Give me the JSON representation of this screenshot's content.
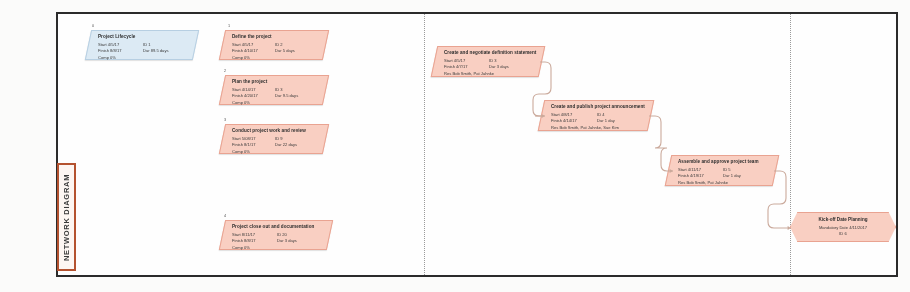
{
  "page": {
    "vertical_label": "NETWORK DIAGRAM",
    "accent_color": "#b4522f",
    "node_fill": "#f9cfc2",
    "node_stroke": "#e9a391",
    "lifecycle_fill": "#dceaf4",
    "lifecycle_stroke": "#b7cfe2",
    "frame_color": "#2b2b2b"
  },
  "nodes": [
    {
      "id_tag": "0",
      "title": "Project Lifecycle",
      "rows": [
        [
          "Start  4/5/17",
          "ID  1"
        ],
        [
          "Finish  8/8/17",
          "Dur  89.5 days"
        ],
        [
          "Comp  0%",
          ""
        ]
      ],
      "style": "blue"
    },
    {
      "id_tag": "1",
      "title": "Define the project",
      "rows": [
        [
          "Start  4/5/17",
          "ID  2"
        ],
        [
          "Finish  4/10/17",
          "Dur  5 days"
        ],
        [
          "Comp  0%",
          ""
        ]
      ],
      "style": "salmon"
    },
    {
      "id_tag": "2",
      "title": "Plan the project",
      "rows": [
        [
          "Start  4/14/17",
          "ID  3"
        ],
        [
          "Finish  4/20/17",
          "Dur  9.5 days"
        ],
        [
          "Comp  0%",
          ""
        ]
      ],
      "style": "salmon"
    },
    {
      "id_tag": "3",
      "title": "Conduct project work and review",
      "rows": [
        [
          "Start  5/08/17",
          "ID  9"
        ],
        [
          "Finish  8/1/17",
          "Dur  22 days"
        ],
        [
          "Comp  0%",
          ""
        ]
      ],
      "style": "salmon"
    },
    {
      "id_tag": "4",
      "title": "Project close out and documentation",
      "rows": [
        [
          "Start  8/11/17",
          "ID  20"
        ],
        [
          "Finish  8/8/17",
          "Dur  3 days"
        ],
        [
          "Comp  0%",
          ""
        ]
      ],
      "style": "salmon"
    },
    {
      "id_tag": "",
      "title": "Create and negotiate definition statement",
      "rows": [
        [
          "Start  4/5/17",
          "ID  3"
        ],
        [
          "Finish  4/7/17",
          "Dur  3 days"
        ],
        [
          "Res   Bob Smith, Pat Jahnke",
          ""
        ]
      ],
      "style": "salmon"
    },
    {
      "id_tag": "",
      "title": "Create and publish project announcement",
      "rows": [
        [
          "Start  4/8/17",
          "ID  4"
        ],
        [
          "Finish  4/14/17",
          "Dur  1 day"
        ],
        [
          "Res   Bob Smith, Pat Jahnke, Sue Kim",
          ""
        ]
      ],
      "style": "salmon"
    },
    {
      "id_tag": "",
      "title": "Assemble and approve project team",
      "rows": [
        [
          "Start  4/11/17",
          "ID  5"
        ],
        [
          "Finish  4/19/17",
          "Dur  1 day"
        ],
        [
          "Res   Bob Smith, Pat Jahnke",
          ""
        ]
      ],
      "style": "salmon"
    }
  ],
  "milestone": {
    "title": "Kick-off Date Planning",
    "lines": [
      "Mandatory Date  4/11/2017",
      "ID  6"
    ]
  }
}
